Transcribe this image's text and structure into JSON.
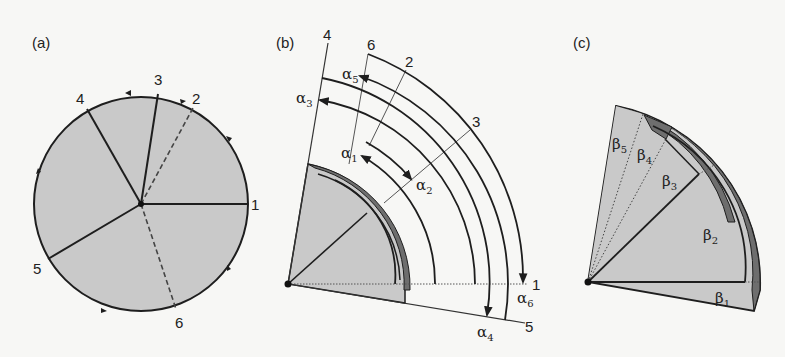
{
  "figure": {
    "panels": [
      {
        "id": "a",
        "label": "(a)"
      },
      {
        "id": "b",
        "label": "(b)"
      },
      {
        "id": "c",
        "label": "(c)"
      }
    ],
    "colors": {
      "background": "#f7f7f5",
      "sector_fill": "#c9c9c9",
      "dark_fill": "#6e6e6e",
      "stroke": "#1e1e1e"
    },
    "panel_a": {
      "points": [
        "1",
        "2",
        "3",
        "4",
        "5",
        "6"
      ],
      "solid_radii": [
        "1",
        "3",
        "4",
        "5"
      ],
      "dashed_radii": [
        "2",
        "6"
      ]
    },
    "panel_b": {
      "ray_labels": [
        "4",
        "6",
        "2",
        "3",
        "1",
        "5"
      ],
      "angles": [
        {
          "name": "α",
          "sub": "1"
        },
        {
          "name": "α",
          "sub": "2"
        },
        {
          "name": "α",
          "sub": "3"
        },
        {
          "name": "α",
          "sub": "4"
        },
        {
          "name": "α",
          "sub": "5"
        },
        {
          "name": "α",
          "sub": "6"
        }
      ]
    },
    "panel_c": {
      "angles": [
        {
          "name": "β",
          "sub": "1"
        },
        {
          "name": "β",
          "sub": "2"
        },
        {
          "name": "β",
          "sub": "3"
        },
        {
          "name": "β",
          "sub": "4"
        },
        {
          "name": "β",
          "sub": "5"
        }
      ]
    }
  }
}
